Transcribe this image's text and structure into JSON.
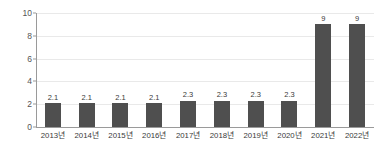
{
  "chart_data": {
    "type": "bar",
    "title": "",
    "subtitle": "",
    "xlabel": "",
    "ylabel": "",
    "categories": [
      "2013년",
      "2014년",
      "2015년",
      "2016년",
      "2017년",
      "2018년",
      "2019년",
      "2020년",
      "2021년",
      "2022년"
    ],
    "values": [
      2.1,
      2.1,
      2.1,
      2.1,
      2.3,
      2.3,
      2.3,
      2.3,
      9,
      9
    ],
    "data_labels": [
      "2.1",
      "2.1",
      "2.1",
      "2.1",
      "2.3",
      "2.3",
      "2.3",
      "2.3",
      "9",
      "9"
    ],
    "ylim": [
      0,
      10
    ],
    "ytick_values": [
      0,
      2,
      4,
      6,
      8,
      10
    ],
    "ytick_labels": [
      "0",
      "2",
      "4",
      "6",
      "8",
      "10"
    ],
    "grid": true,
    "grid_axis": "y",
    "legend": null,
    "bar_color": "#4f4f4f",
    "grid_color": "#e9e9e9",
    "axis_color": "#9a9a9a",
    "label_color": "#3a3a3a",
    "background_color": "#ffffff"
  }
}
